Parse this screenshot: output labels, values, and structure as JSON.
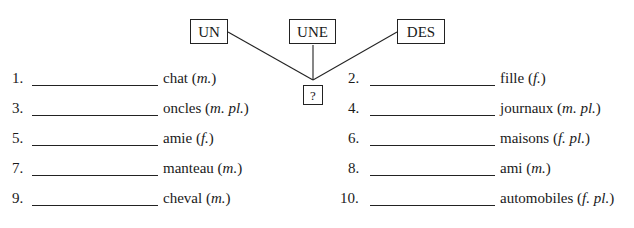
{
  "diagram": {
    "articles": [
      {
        "label": "UN"
      },
      {
        "label": "UNE"
      },
      {
        "label": "DES"
      }
    ],
    "target": {
      "label": "?"
    }
  },
  "exercise": {
    "items": [
      {
        "number": "1.",
        "noun": "chat",
        "gender": "m.",
        "answer": ""
      },
      {
        "number": "2.",
        "noun": "fille",
        "gender": "f.",
        "answer": ""
      },
      {
        "number": "3.",
        "noun": "oncles",
        "gender": "m. pl.",
        "answer": ""
      },
      {
        "number": "4.",
        "noun": "journaux",
        "gender": "m. pl.",
        "answer": ""
      },
      {
        "number": "5.",
        "noun": "amie",
        "gender": "f.",
        "answer": ""
      },
      {
        "number": "6.",
        "noun": "maisons",
        "gender": "f. pl.",
        "answer": ""
      },
      {
        "number": "7.",
        "noun": "manteau",
        "gender": "m.",
        "answer": ""
      },
      {
        "number": "8.",
        "noun": "ami",
        "gender": "m.",
        "answer": ""
      },
      {
        "number": "9.",
        "noun": "cheval",
        "gender": "m.",
        "answer": ""
      },
      {
        "number": "10.",
        "noun": "automobiles",
        "gender": "f. pl.",
        "answer": ""
      }
    ],
    "paren_open": "(",
    "paren_close": ")"
  }
}
